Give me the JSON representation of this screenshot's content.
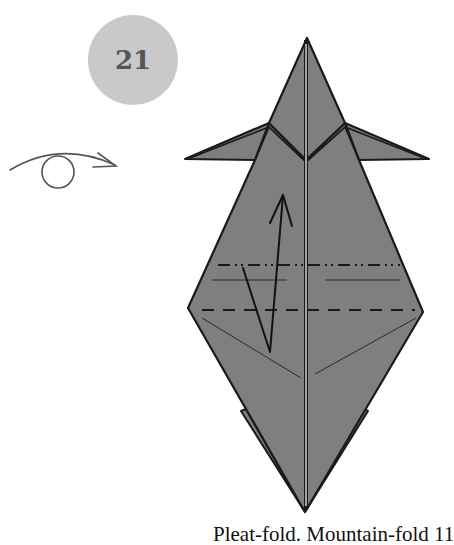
{
  "step": {
    "number": "21",
    "circle_color": "#c9c9c9"
  },
  "symbols": {
    "turn_over": "turn-over-icon"
  },
  "model": {
    "paper_color": "#7f7f7f",
    "outline_color": "#1a1a1a",
    "fold_lines": [
      "mountain-fold",
      "valley-fold",
      "pleat-arrow"
    ]
  },
  "caption": {
    "text": "Pleat-fold. Mountain-fold 11"
  }
}
